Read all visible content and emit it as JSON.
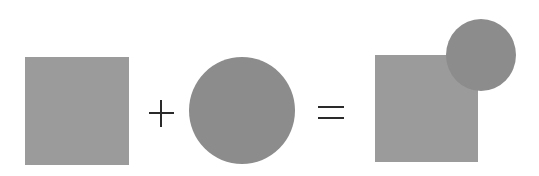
{
  "diagram": {
    "operators": {
      "plus": "+",
      "equals": "="
    },
    "elements": [
      {
        "id": "operand-square",
        "shape": "square",
        "color": "#9b9b9b"
      },
      {
        "id": "operand-circle",
        "shape": "circle",
        "color": "#8c8c8c"
      },
      {
        "id": "result-square",
        "shape": "square",
        "color": "#9b9b9b"
      },
      {
        "id": "result-circle",
        "shape": "circle",
        "color": "#8c8c8c"
      }
    ],
    "background": "#ffffff",
    "operator_color": "#2a2a2a"
  }
}
